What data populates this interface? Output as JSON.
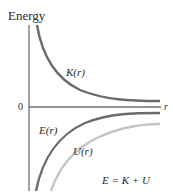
{
  "figure": {
    "y_axis_label": "Energy",
    "x_axis_label": "r",
    "origin_label": "0",
    "equation": "E = K + U",
    "curves": [
      {
        "id": "kinetic",
        "label": "K(r)",
        "color": "#6b6b6b"
      },
      {
        "id": "total",
        "label": "E(r)",
        "color": "#6b6b6b"
      },
      {
        "id": "potential",
        "label": "U(r)",
        "color": "#c4c4c4"
      }
    ],
    "axis_color": "#6e6e6e"
  }
}
